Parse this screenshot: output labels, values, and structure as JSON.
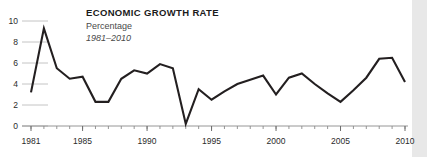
{
  "chart_data": {
    "type": "line",
    "title": "ECONOMIC GROWTH RATE",
    "subtitle": "Percentage",
    "period": "1981–2010",
    "xlabel": "",
    "ylabel": "",
    "xlim": [
      1981,
      2010
    ],
    "ylim": [
      0,
      10
    ],
    "grid": "horizontal-short",
    "legend": "none",
    "line_color": "#231f20",
    "y_ticks": [
      0,
      2,
      4,
      6,
      8,
      10
    ],
    "y_tick_labels": [
      "0",
      "2",
      "4",
      "6",
      "8",
      "10"
    ],
    "x_ticks": [
      1981,
      1985,
      1990,
      1995,
      2000,
      2005,
      2010
    ],
    "x_tick_labels": [
      "1981",
      "1985",
      "1990",
      "1995",
      "2000",
      "2005",
      "2010"
    ],
    "x_minor_tick_interval": 1,
    "x": [
      1981,
      1982,
      1983,
      1984,
      1985,
      1986,
      1987,
      1988,
      1989,
      1990,
      1991,
      1992,
      1993,
      1994,
      1995,
      1996,
      1997,
      1998,
      1999,
      2000,
      2001,
      2002,
      2003,
      2004,
      2005,
      2006,
      2007,
      2008,
      2009,
      2010
    ],
    "values": [
      3.2,
      9.3,
      5.5,
      4.5,
      4.7,
      2.3,
      2.3,
      4.5,
      5.3,
      5.0,
      5.9,
      5.5,
      0.2,
      3.5,
      2.5,
      3.3,
      4.0,
      4.4,
      4.8,
      3.0,
      4.6,
      5.0,
      4.0,
      3.1,
      2.3,
      3.4,
      4.6,
      6.4,
      6.5,
      4.2
    ],
    "series_name": "Economic growth rate"
  },
  "figure": {
    "background_color": "#ffffff",
    "margin_strip_color": "#e8e8e8"
  }
}
